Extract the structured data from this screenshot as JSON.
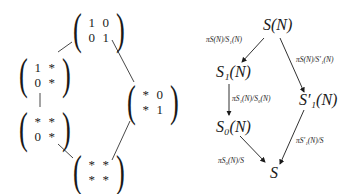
{
  "left_diagram": {
    "matrices": [
      {
        "id": "top",
        "cells": [
          "1",
          "0",
          "0",
          "1"
        ]
      },
      {
        "id": "upper-left",
        "cells": [
          "1",
          "*",
          "0",
          "*"
        ]
      },
      {
        "id": "lower-left",
        "cells": [
          "*",
          "*",
          "0",
          "*"
        ]
      },
      {
        "id": "right",
        "cells": [
          "*",
          "0",
          "*",
          "1"
        ]
      },
      {
        "id": "bottom",
        "cells": [
          "*",
          "*",
          "*",
          "*"
        ]
      }
    ]
  },
  "right_diagram": {
    "nodes": {
      "sn": "S(N)",
      "s1n": "S₁(N)",
      "s1pn": "S′₁(N)",
      "s0n": "S₀(N)",
      "s": "S"
    },
    "arrows": {
      "sn_to_s1n": "πS(N)/S₁(N)",
      "sn_to_s1pn": "πS(N)/S′₁(N)",
      "s1n_to_s0n": "πS₁(N)/S₀(N)",
      "s1pn_to_s": "πS′₁(N)/S",
      "s0n_to_s": "πS₀(N)/S"
    }
  }
}
